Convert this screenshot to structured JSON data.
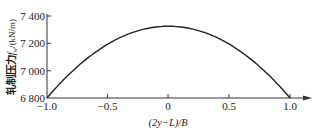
{
  "chart_data": {
    "type": "line",
    "title": "",
    "xlabel": "(2y−L)/B",
    "ylabel": "轧制压力 f_w /(kN/m)",
    "ylabel_main": "轧制压力",
    "ylabel_sym": "f",
    "ylabel_sub": "w",
    "ylabel_unit": "/(kN/m)",
    "xlim": [
      -1.0,
      1.0
    ],
    "ylim": [
      6800,
      7400
    ],
    "xticks": [
      "−1.0",
      "−0.5",
      "0",
      "0.5",
      "1.0"
    ],
    "yticks": [
      "6 800",
      "7 000",
      "7 200",
      "7 400"
    ],
    "grid": false,
    "series": [
      {
        "name": "rolling force distribution",
        "x": [
          -1.0,
          -0.75,
          -0.5,
          -0.25,
          0,
          0.25,
          0.5,
          0.75,
          1.0
        ],
        "y": [
          6800,
          7030,
          7195,
          7293,
          7325,
          7293,
          7195,
          7030,
          6800
        ]
      }
    ]
  }
}
